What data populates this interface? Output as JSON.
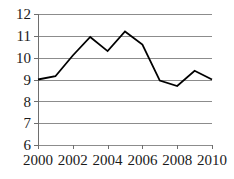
{
  "chart_data": {
    "type": "line",
    "title": "",
    "subtitle": "",
    "xlabel": "",
    "ylabel": "",
    "x": [
      2000,
      2001,
      2002,
      2003,
      2004,
      2005,
      2006,
      2007,
      2008,
      2009,
      2010
    ],
    "values": [
      9.0,
      9.15,
      10.1,
      10.95,
      10.3,
      11.2,
      10.6,
      8.95,
      8.7,
      9.4,
      9.0
    ],
    "series": [
      {
        "name": "",
        "values": [
          9.0,
          9.15,
          10.1,
          10.95,
          10.3,
          11.2,
          10.6,
          8.95,
          8.7,
          9.4,
          9.0
        ]
      }
    ],
    "xlim": [
      2000,
      2010
    ],
    "ylim": [
      6,
      12
    ],
    "y_ticks": [
      6,
      7,
      8,
      9,
      10,
      11,
      12
    ],
    "y_tick_labels": [
      "6",
      "7",
      "8",
      "9",
      "10",
      "11",
      "12"
    ],
    "x_ticks": [
      2000,
      2002,
      2004,
      2006,
      2008,
      2010
    ],
    "x_tick_labels": [
      "2000",
      "2002",
      "2004",
      "2006",
      "2008",
      "2010"
    ],
    "grid": "horizontal",
    "legend": "none",
    "annotations": [],
    "colors": {
      "line": "#000000",
      "gridline": "#8c8c8c",
      "axis": "#6e6e6e",
      "text": "#1a1a1a",
      "background": "#ffffff"
    }
  },
  "layout": {
    "plot_left": 38,
    "plot_right": 212,
    "plot_top": 14,
    "plot_bottom": 145,
    "x_label_baseline": 165,
    "tick_length": 4
  }
}
